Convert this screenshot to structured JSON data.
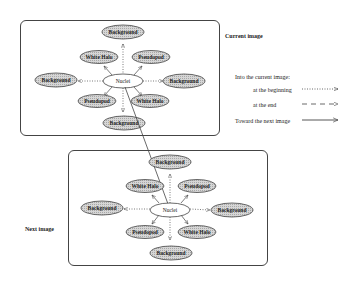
{
  "diagram": {
    "panels": [
      {
        "name": "current-image",
        "label": "Current image"
      },
      {
        "name": "next-image",
        "label": "Next image"
      }
    ],
    "nodes": {
      "center": "Nuclei",
      "background": "Background",
      "white_halo": "White Halo",
      "pseudopod": "Pseudopod"
    },
    "legend": {
      "title": "Into the current image:",
      "at_beginning": "at the beginning",
      "at_end": "at the end",
      "toward_next": "Toward the next image"
    },
    "colors": {
      "node_fill": "#c8c8c8",
      "center_fill": "#ffffff",
      "stroke": "#444444"
    }
  }
}
